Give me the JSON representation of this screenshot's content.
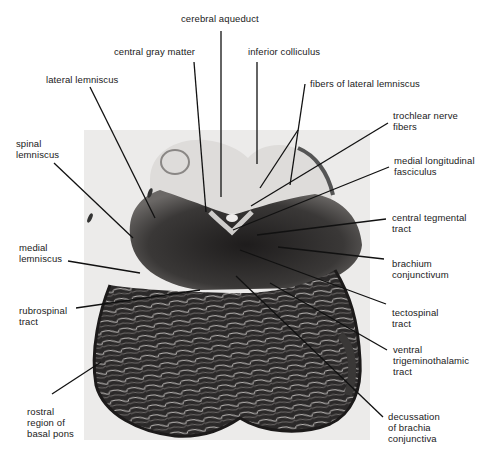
{
  "figure": {
    "labels": {
      "cerebral_aqueduct": "cerebral aqueduct",
      "central_gray_matter": "central gray matter",
      "inferior_colliculus": "inferior colliculus",
      "lateral_lemniscus": "lateral lemniscus",
      "fibers_of_lateral_lemniscus": "fibers of lateral lemniscus",
      "trochlear_nerve_fibers": "trochlear nerve\nfibers",
      "spinal_lemniscus": "spinal\nlemniscus",
      "medial_longitudinal_fasciculus": "medial longitudinal\nfasciculus",
      "central_tegmental_tract": "central tegmental\ntract",
      "medial_lemniscus": "medial\nlemniscus",
      "brachium_conjunctivum": "brachium\nconjunctivum",
      "rubrospinal_tract": "rubrospinal\ntract",
      "tectospinal_tract": "tectospinal\ntract",
      "ventral_trigeminothalamic_tract": "ventral\ntrigeminothalamic\ntract",
      "rostral_region_of_basal_pons": "rostral\nregion of\nbasal pons",
      "decussation_of_brachia_conjunctiva": "decussation\nof brachia\nconjunctiva"
    },
    "colors": {
      "background": "#ffffff",
      "photo_backdrop": "#ecebea",
      "tissue_dark": "#2a2828",
      "tissue_mid": "#5a5756",
      "tissue_light": "#d8d6d4",
      "leader_line": "#111111",
      "label_text": "#1a1a1a"
    }
  }
}
